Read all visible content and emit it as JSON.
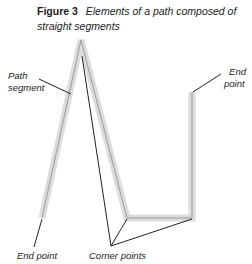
{
  "figure": {
    "number_label": "Figure 3",
    "title": "Elements of a path composed of straight segments"
  },
  "labels": {
    "path_segment_line1": "Path",
    "path_segment_line2": "segment",
    "end_point_right_line1": "End",
    "end_point_right_line2": "point",
    "end_point_bottom": "End point",
    "corner_points": "Corner points"
  },
  "colors": {
    "path_halo": "#d9d9d9",
    "path_line": "#9a9a9a",
    "leader_line": "#222222"
  }
}
